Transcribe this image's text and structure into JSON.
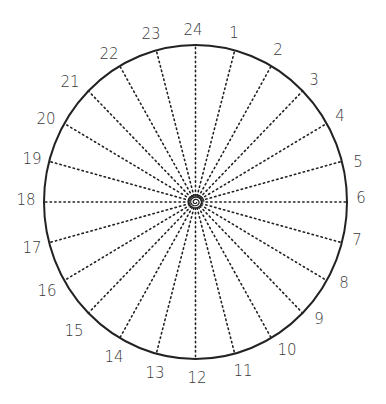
{
  "diagram": {
    "type": "24-hour radial clock dial",
    "center": {
      "x": 195.5,
      "y": 202
    },
    "radius": {
      "rx": 151.5,
      "ry": 157
    },
    "stroke_color": "#222222",
    "label_color": "#3a3a3a",
    "spoke_count": 24,
    "spoke_style": "dotted",
    "hours": [
      {
        "label": "24",
        "x": 193,
        "y": 30
      },
      {
        "label": "1",
        "x": 234,
        "y": 33
      },
      {
        "label": "2",
        "x": 278,
        "y": 50
      },
      {
        "label": "3",
        "x": 314,
        "y": 80
      },
      {
        "label": "4",
        "x": 340,
        "y": 116
      },
      {
        "label": "5",
        "x": 358,
        "y": 162
      },
      {
        "label": "6",
        "x": 361,
        "y": 198
      },
      {
        "label": "7",
        "x": 357,
        "y": 240
      },
      {
        "label": "8",
        "x": 344,
        "y": 283
      },
      {
        "label": "9",
        "x": 319,
        "y": 319
      },
      {
        "label": "10",
        "x": 287,
        "y": 350
      },
      {
        "label": "11",
        "x": 243,
        "y": 371
      },
      {
        "label": "12",
        "x": 197,
        "y": 378
      },
      {
        "label": "13",
        "x": 155,
        "y": 373
      },
      {
        "label": "14",
        "x": 114,
        "y": 357
      },
      {
        "label": "15",
        "x": 74,
        "y": 331
      },
      {
        "label": "16",
        "x": 47,
        "y": 291
      },
      {
        "label": "17",
        "x": 32,
        "y": 248
      },
      {
        "label": "18",
        "x": 26,
        "y": 200
      },
      {
        "label": "19",
        "x": 32,
        "y": 159
      },
      {
        "label": "20",
        "x": 46,
        "y": 119
      },
      {
        "label": "21",
        "x": 70,
        "y": 82
      },
      {
        "label": "22",
        "x": 109,
        "y": 54
      },
      {
        "label": "23",
        "x": 151,
        "y": 34
      }
    ]
  }
}
